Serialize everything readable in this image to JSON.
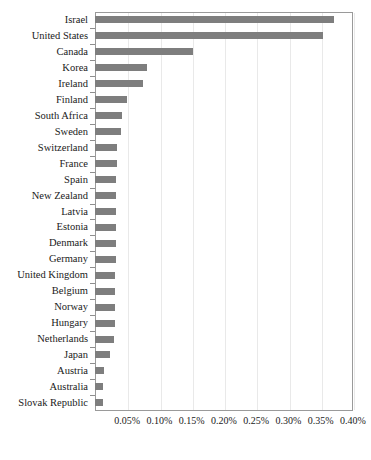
{
  "chart_data": {
    "type": "bar",
    "orientation": "horizontal",
    "title": "",
    "subtitle": "",
    "xlabel": "",
    "ylabel": "",
    "xlim": [
      0,
      0.4
    ],
    "xunit": "%",
    "xticks": [
      "0.05%",
      "0.10%",
      "0.15%",
      "0.20%",
      "0.25%",
      "0.30%",
      "0.35%",
      "0.40%"
    ],
    "xtick_values": [
      0.05,
      0.1,
      0.15,
      0.2,
      0.25,
      0.3,
      0.35,
      0.4
    ],
    "grid": "vertical",
    "legend": "none",
    "bar_color": "#7e7e7e",
    "categories": [
      "Israel",
      "United States",
      "Canada",
      "Korea",
      "Ireland",
      "Finland",
      "South Africa",
      "Sweden",
      "Switzerland",
      "France",
      "Spain",
      "New Zealand",
      "Latvia",
      "Estonia",
      "Denmark",
      "Germany",
      "United Kingdom",
      "Belgium",
      "Norway",
      "Hungary",
      "Netherlands",
      "Japan",
      "Austria",
      "Australia",
      "Slovak Republic"
    ],
    "values": [
      0.371,
      0.354,
      0.152,
      0.08,
      0.074,
      0.049,
      0.042,
      0.04,
      0.034,
      0.034,
      0.033,
      0.033,
      0.033,
      0.032,
      0.032,
      0.032,
      0.031,
      0.031,
      0.031,
      0.031,
      0.03,
      0.024,
      0.014,
      0.013,
      0.013
    ]
  }
}
